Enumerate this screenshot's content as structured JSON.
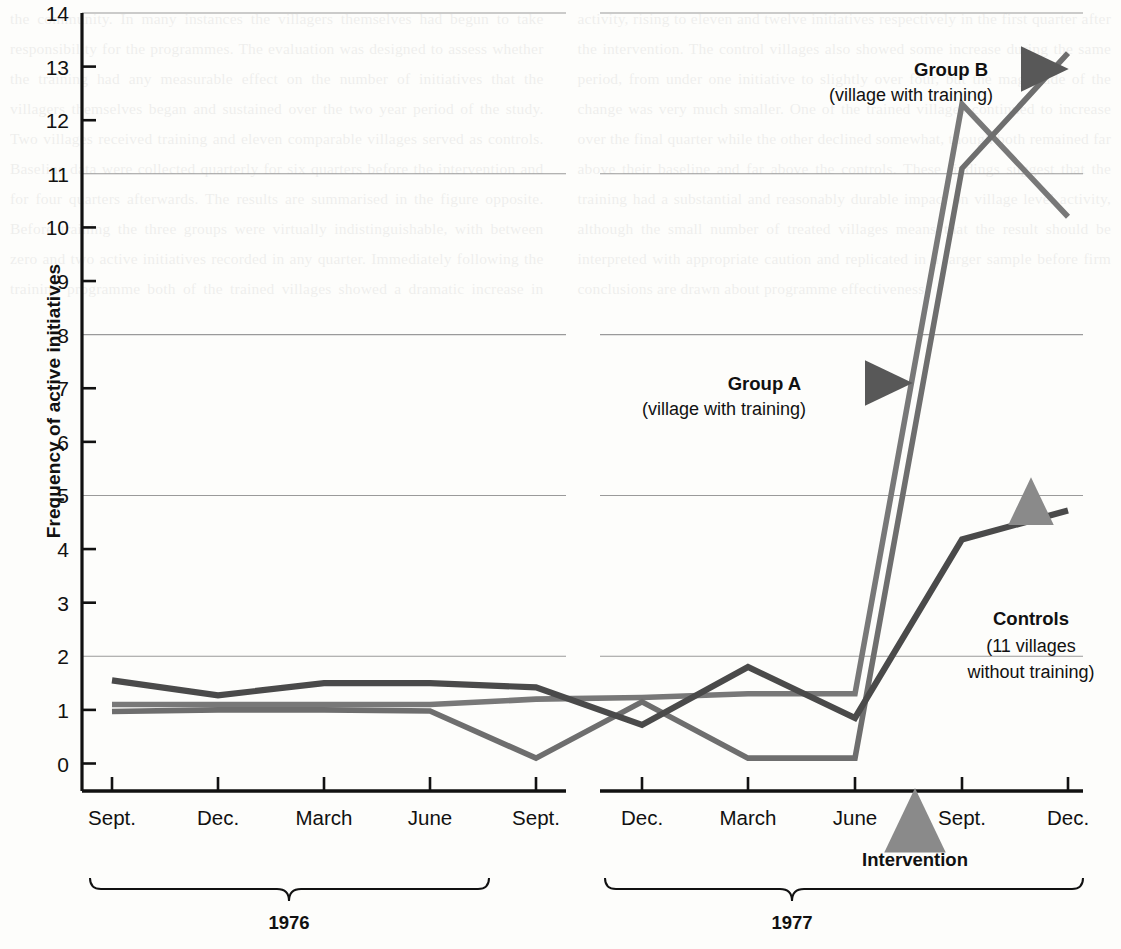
{
  "chart_data": {
    "type": "line",
    "title": "",
    "xlabel": "",
    "ylabel": "Frequency of active initiatives",
    "ylim": [
      0,
      14
    ],
    "yticks": [
      0,
      1,
      2,
      3,
      4,
      5,
      6,
      7,
      8,
      9,
      10,
      11,
      12,
      13,
      14
    ],
    "gridlines": [
      2,
      5,
      8,
      11,
      14
    ],
    "grid": true,
    "legend_position": "inline-annotations",
    "categories": [
      "Sept.",
      "Dec.",
      "March",
      "June",
      "Sept.",
      "Dec.",
      "March",
      "June",
      "Sept.",
      "Dec."
    ],
    "period_groups": [
      {
        "label": "1976",
        "from_index": 0,
        "to_index": 5
      },
      {
        "label": "1977",
        "from_index": 6,
        "to_index": 9
      }
    ],
    "series": [
      {
        "name": "Controls",
        "sublabel": "(11 villages without training)",
        "color": "#4a4a4a",
        "values": [
          1.55,
          1.27,
          1.5,
          1.5,
          1.42,
          0.72,
          1.8,
          0.85,
          4.18,
          4.72
        ]
      },
      {
        "name": "Group A",
        "sublabel": "(village with training)",
        "color": "#787878",
        "values": [
          1.1,
          1.1,
          1.1,
          1.1,
          1.2,
          1.23,
          1.3,
          1.3,
          12.3,
          10.2
        ]
      },
      {
        "name": "Group B",
        "sublabel": "(village with training)",
        "color": "#6e6e6e",
        "values": [
          0.97,
          1.0,
          1.0,
          0.98,
          0.1,
          1.15,
          0.1,
          0.1,
          11.1,
          13.25
        ]
      }
    ],
    "annotations": [
      {
        "name": "Group B",
        "sublabel": "(village with training)",
        "arrow": "right"
      },
      {
        "name": "Group A",
        "sublabel": "(village with training)",
        "arrow": "right"
      },
      {
        "name": "Controls",
        "sublabel_line1": "(11 villages",
        "sublabel_line2": "without training)",
        "arrow": "up"
      },
      {
        "name": "Intervention",
        "arrow": "up",
        "between": [
          "June",
          "Sept."
        ],
        "year": "1977"
      }
    ]
  },
  "axis": {
    "y_title": "Frequency of active initiatives",
    "y_tick_labels": [
      "14",
      "13",
      "12",
      "11",
      "10",
      "9",
      "8",
      "7",
      "6",
      "5",
      "4",
      "3",
      "2",
      "1",
      "0"
    ],
    "x_tick_labels": [
      "Sept.",
      "Dec.",
      "March",
      "June",
      "Sept.",
      "Dec.",
      "March",
      "June",
      "Sept.",
      "Dec."
    ]
  },
  "labels": {
    "group_b_name": "Group B",
    "group_b_sub": "(village with training)",
    "group_a_name": "Group A",
    "group_a_sub": "(village with training)",
    "controls_name": "Controls",
    "controls_sub1": "(11 villages",
    "controls_sub2": "without training)",
    "intervention": "Intervention",
    "year_1976": "1976",
    "year_1977": "1977"
  },
  "colors": {
    "controls": "#4a4a4a",
    "group_a": "#787878",
    "group_b": "#6e6e6e",
    "axis": "#111111",
    "grid": "#9a9a9a",
    "background": "#fdfdfb"
  },
  "background_text": "the community. In many instances the villagers themselves had begun to take responsibility for the programmes. The evaluation was designed to assess whether the training had any measurable effect on the number of initiatives that the villagers themselves began and sustained over the two year period of the study. Two villages received training and eleven comparable villages served as controls. Baseline data were collected quarterly for six quarters before the intervention and for four quarters afterwards. The results are summarised in the figure opposite. Before training the three groups were virtually indistinguishable, with between zero and two active initiatives recorded in any quarter. Immediately following the training programme both of the trained villages showed a dramatic increase in activity, rising to eleven and twelve initiatives respectively in the first quarter after the intervention. The control villages also showed some increase during the same period, from under one initiative to slightly over four, but the magnitude of the change was very much smaller. One of the trained villages continued to increase over the final quarter while the other declined somewhat, though both remained far above their baseline and far above the controls. These findings suggest that the training had a substantial and reasonably durable impact on village level activity, although the small number of treated villages means that the result should be interpreted with appropriate caution and replicated in a larger sample before firm conclusions are drawn about programme effectiveness."
}
